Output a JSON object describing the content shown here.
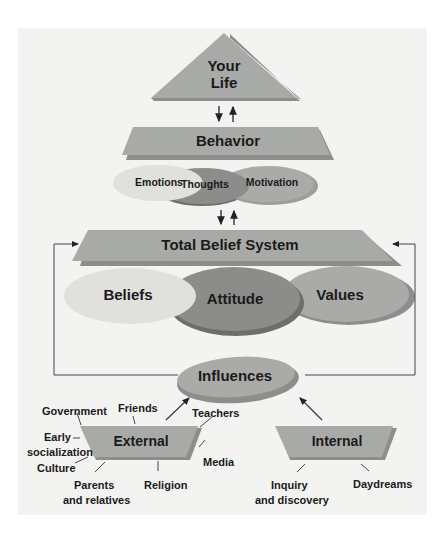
{
  "diagram": {
    "colors": {
      "panel_bg": "#f3f3f2",
      "band": "#a8aaa7",
      "band_shadow": "#8d8e8c",
      "ellipse_light": "#e0e0dc",
      "ellipse_mid": "#aaaba8",
      "ellipse_dark": "#8c8d8b",
      "line": "#333333"
    },
    "top": {
      "line1": "Your",
      "line2": "Life"
    },
    "behavior": {
      "label": "Behavior"
    },
    "behavior_components": [
      {
        "label": "Emotions"
      },
      {
        "label": "Thoughts"
      },
      {
        "label": "Motivation"
      }
    ],
    "belief_system": {
      "label": "Total Belief System"
    },
    "belief_components": [
      {
        "label": "Beliefs"
      },
      {
        "label": "Attitude"
      },
      {
        "label": "Values"
      }
    ],
    "influences": {
      "label": "Influences"
    },
    "external": {
      "label": "External",
      "sources": [
        {
          "label": "Government"
        },
        {
          "label": "Friends"
        },
        {
          "label": "Teachers"
        },
        {
          "label": "Early"
        },
        {
          "label": "socialization"
        },
        {
          "label": "Culture"
        },
        {
          "label": "Media"
        },
        {
          "label": "Parents"
        },
        {
          "label": "and relatives"
        },
        {
          "label": "Religion"
        }
      ]
    },
    "internal": {
      "label": "Internal",
      "sources": [
        {
          "label": "Inquiry"
        },
        {
          "label": "and discovery"
        },
        {
          "label": "Daydreams"
        }
      ]
    }
  }
}
